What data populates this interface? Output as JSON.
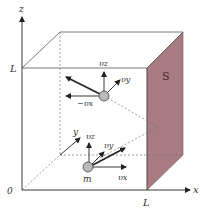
{
  "diagram": {
    "axes": {
      "x": "x",
      "y": "y",
      "z": "z",
      "origin": "0"
    },
    "ticks": {
      "x_L": "L",
      "z_L": "L"
    },
    "face_label": "S",
    "face_color": "#a87a82",
    "particles": [
      {
        "label": "",
        "vectors": [
          "v_z",
          "v_y",
          "−v_x"
        ]
      },
      {
        "label": "m",
        "vectors": [
          "v_z",
          "v_y",
          "v_x"
        ]
      }
    ],
    "labels": {
      "top_vz": "υz",
      "top_vy": "υy",
      "top_neg_vx": "−υx",
      "bot_vz": "υz",
      "bot_vy": "υy",
      "bot_vx": "υx",
      "mass": "m"
    }
  }
}
